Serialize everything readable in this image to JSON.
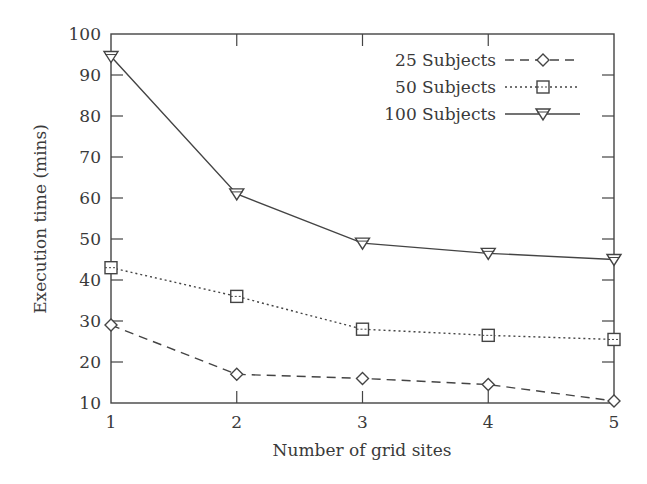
{
  "chart_data": {
    "type": "line",
    "title": "",
    "xlabel": "Number of grid sites",
    "ylabel": "Execution time (mins)",
    "x": [
      1,
      2,
      3,
      4,
      5
    ],
    "xticks": [
      "1",
      "2",
      "3",
      "4",
      "5"
    ],
    "yticks": [
      "10",
      "20",
      "30",
      "40",
      "50",
      "60",
      "70",
      "80",
      "90",
      "100"
    ],
    "xlim": [
      1,
      5
    ],
    "ylim": [
      10,
      100
    ],
    "grid": false,
    "legend_position": "upper right",
    "series": [
      {
        "name": "25 Subjects",
        "line_style": "dashed",
        "marker": "diamond",
        "values": [
          29,
          17,
          16,
          14.5,
          10.5
        ]
      },
      {
        "name": "50 Subjects",
        "line_style": "dotted",
        "marker": "square",
        "values": [
          43,
          36,
          28,
          26.5,
          25.5
        ]
      },
      {
        "name": "100 Subjects",
        "line_style": "solid",
        "marker": "triangle-down",
        "values": [
          94.5,
          61,
          49,
          46.5,
          45
        ]
      }
    ],
    "colors": {
      "line": "#444444",
      "axis": "#444444",
      "text": "#3a3a3a",
      "background": "#ffffff"
    }
  }
}
